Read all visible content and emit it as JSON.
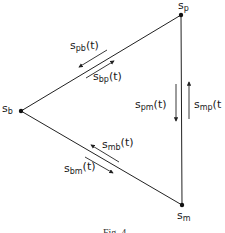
{
  "diagram": {
    "nodes": [
      {
        "id": "sp",
        "base": "s",
        "sub": "p"
      },
      {
        "id": "sb",
        "base": "s",
        "sub": "b"
      },
      {
        "id": "sm",
        "base": "s",
        "sub": "m"
      }
    ],
    "edges": [
      {
        "from": "sp",
        "to": "sb"
      },
      {
        "from": "sp",
        "to": "sm"
      },
      {
        "from": "sb",
        "to": "sm"
      }
    ],
    "flows": [
      {
        "id": "spb",
        "base": "s",
        "sub": "pb",
        "arg": "(t)",
        "from": "sp",
        "to": "sb"
      },
      {
        "id": "sbp",
        "base": "s",
        "sub": "bp",
        "arg": "(t)",
        "from": "sb",
        "to": "sp"
      },
      {
        "id": "spm",
        "base": "s",
        "sub": "pm",
        "arg": "(t)",
        "from": "sp",
        "to": "sm"
      },
      {
        "id": "smp",
        "base": "s",
        "sub": "mp",
        "arg": "(t",
        "from": "sm",
        "to": "sp"
      },
      {
        "id": "smb",
        "base": "s",
        "sub": "mb",
        "arg": "(t)",
        "from": "sm",
        "to": "sb"
      },
      {
        "id": "sbm",
        "base": "s",
        "sub": "bm",
        "arg": "(t)",
        "from": "sb",
        "to": "sm"
      }
    ],
    "caption": "Fig. 4"
  }
}
